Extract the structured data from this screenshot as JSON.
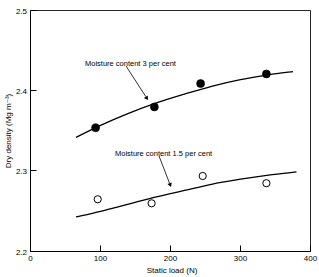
{
  "chart_data": {
    "type": "scatter",
    "title": "",
    "xlabel": "Static load (N)",
    "ylabel": "Dry density (Mg m⁻³)",
    "xlim": [
      0,
      400
    ],
    "ylim": [
      2.2,
      2.5
    ],
    "xticks": [
      0,
      100,
      200,
      300,
      400
    ],
    "xtick_labels": [
      "0",
      "100",
      "200",
      "300",
      "400"
    ],
    "yticks": [
      2.2,
      2.3,
      2.4,
      2.5
    ],
    "ytick_labels": [
      "2.2",
      "2.3",
      "2.4",
      "2.5"
    ],
    "grid": false,
    "legend": "none",
    "series": [
      {
        "name": "Moisture content 3 per cent",
        "marker": "filled-circle",
        "x": [
          93,
          177,
          243,
          337
        ],
        "y": [
          2.354,
          2.38,
          2.409,
          2.421
        ],
        "fit_curve": {
          "x": [
            65,
            100,
            140,
            180,
            220,
            260,
            300,
            340,
            375
          ],
          "y": [
            2.342,
            2.357,
            2.372,
            2.385,
            2.396,
            2.406,
            2.414,
            2.42,
            2.424
          ]
        }
      },
      {
        "name": "Moisture content 1.5 per cent",
        "marker": "open-circle",
        "x": [
          96,
          173,
          246,
          337
        ],
        "y": [
          2.265,
          2.26,
          2.294,
          2.285
        ],
        "fit_curve": {
          "x": [
            65,
            100,
            140,
            180,
            220,
            260,
            300,
            340,
            380
          ],
          "y": [
            2.243,
            2.25,
            2.259,
            2.268,
            2.276,
            2.284,
            2.29,
            2.295,
            2.299
          ]
        }
      }
    ],
    "annotations": [
      {
        "id": "annotation-upper",
        "text": "Moisture content 3 per cent",
        "text_x": 85,
        "text_y": 63,
        "leader_from_x": 126,
        "leader_from_y": 66,
        "leader_to_x": 148,
        "leader_to_y": 100
      },
      {
        "id": "annotation-lower",
        "text": "Moisture content 1.5 per cent",
        "text_x": 115,
        "text_y": 153,
        "leader_from_x": 159,
        "leader_from_y": 156,
        "leader_to_x": 171,
        "leader_to_y": 187
      }
    ]
  }
}
